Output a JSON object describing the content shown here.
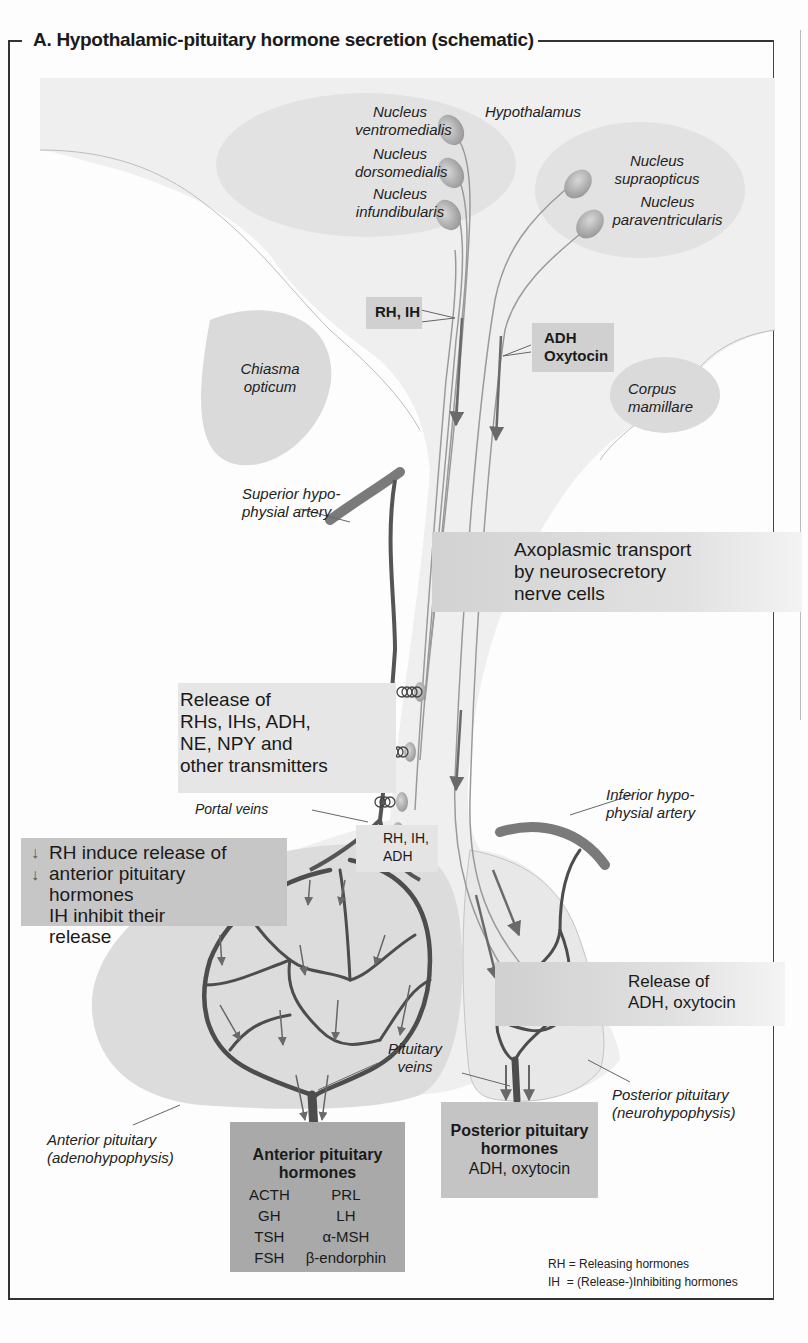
{
  "title": "A. Hypothalamic-pituitary hormone secretion (schematic)",
  "regions": {
    "hypothalamus": "Hypothalamus",
    "chiasma_line1": "Chiasma",
    "chiasma_line2": "opticum",
    "corpus_line1": "Corpus",
    "corpus_line2": "mamillare",
    "anterior_pituitary_line1": "Anterior pituitary",
    "anterior_pituitary_line2": "(adenohypophysis)",
    "posterior_pituitary_line1": "Posterior pituitary",
    "posterior_pituitary_line2": "(neurohypophysis)"
  },
  "nuclei": [
    {
      "line1": "Nucleus",
      "line2": "ventromedialis"
    },
    {
      "line1": "Nucleus",
      "line2": "dorsomedialis"
    },
    {
      "line1": "Nucleus",
      "line2": "infundibularis"
    },
    {
      "line1": "Nucleus",
      "line2": "supraopticus"
    },
    {
      "line1": "Nucleus",
      "line2": "paraventricularis"
    }
  ],
  "vessels": {
    "superior_artery_line1": "Superior hypo-",
    "superior_artery_line2": "physial artery",
    "inferior_artery_line1": "Inferior hypo-",
    "inferior_artery_line2": "physial artery",
    "portal_veins": "Portal veins",
    "pituitary_veins_line1": "Pituitary",
    "pituitary_veins_line2": "veins"
  },
  "callouts": {
    "rh_ih": "RH, IH",
    "adh_oxytocin_line1": "ADH",
    "adh_oxytocin_line2": "Oxytocin",
    "axoplasmic_line1": "Axoplasmic transport",
    "axoplasmic_line2": "by neurosecretory",
    "axoplasmic_line3": "nerve cells",
    "release_line1": "Release of",
    "release_line2": "RHs, IHs, ADH,",
    "release_line3": "NE, NPY and",
    "release_line4": "other transmitters",
    "rh_ih_adh_line1": "RH, IH,",
    "rh_ih_adh_line2": "ADH",
    "induce_line1": "RH induce release of",
    "induce_line2": "anterior pituitary",
    "induce_line3": "hormones",
    "induce_line4": "IH inhibit their",
    "induce_line5": "release",
    "release_adh_line1": "Release of",
    "release_adh_line2": "ADH, oxytocin"
  },
  "anterior_hormones": {
    "header_line1": "Anterior pituitary",
    "header_line2": "hormones",
    "rows": [
      [
        "ACTH",
        "PRL"
      ],
      [
        "GH",
        "LH"
      ],
      [
        "TSH",
        "α-MSH"
      ],
      [
        "FSH",
        "β-endorphin"
      ]
    ]
  },
  "posterior_hormones": {
    "header_line1": "Posterior pituitary",
    "header_line2": "hormones",
    "value": "ADH, oxytocin"
  },
  "legend": {
    "rh": "RH = Releasing hormones",
    "ih": "IH  = (Release-)Inhibiting hormones"
  },
  "colors": {
    "tissue": "#ededed",
    "nucleus_region": "#e2e2e2",
    "vessel": "#555555",
    "box_medium": "#d0d0d0",
    "box_dark": "#a9a9a9",
    "axon": "#9a9a9a"
  }
}
